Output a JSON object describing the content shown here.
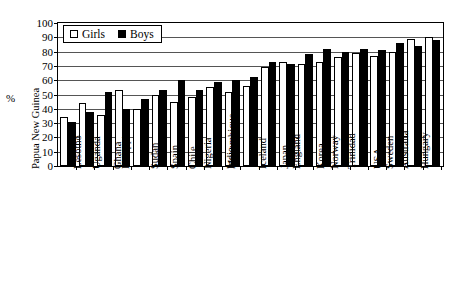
{
  "chart_data": {
    "type": "bar",
    "title": "",
    "xlabel": "",
    "ylabel": "%",
    "ylim": [
      0,
      100
    ],
    "ytick_step": 10,
    "yticks": [
      0,
      10,
      20,
      30,
      40,
      50,
      60,
      70,
      80,
      90,
      100
    ],
    "grid": true,
    "legend_position": "top-left-inside",
    "orientation": "vertical-grouped",
    "xtick_label_rotation": 90,
    "categories": [
      "Papua New Guinea",
      "Lesotho",
      "Uganda",
      "Ghana",
      "Philippines",
      "Sudan",
      "Spain",
      "Chile",
      "Nigeria",
      "India",
      "Mozambique",
      "Iceland",
      "Japan",
      "England",
      "Korea",
      "Norway",
      "Trinidad",
      "USA",
      "Sweden",
      "Australia",
      "Hungary"
    ],
    "series": [
      {
        "name": "Girls",
        "color": "#ffffff",
        "edge_color": "#000000",
        "values": [
          34,
          44,
          36,
          53,
          40,
          50,
          45,
          48,
          55,
          52,
          56,
          69,
          73,
          71,
          73,
          76,
          79,
          77,
          80,
          89,
          90
        ]
      },
      {
        "name": "Boys",
        "color": "#000000",
        "edge_color": "#000000",
        "values": [
          31,
          38,
          52,
          40,
          47,
          53,
          60,
          53,
          59,
          60,
          62,
          73,
          71,
          78,
          82,
          80,
          82,
          81,
          86,
          84,
          88
        ]
      }
    ]
  },
  "legend": {
    "items": [
      {
        "label": "Girls",
        "swatch": "open-square"
      },
      {
        "label": "Boys",
        "swatch": "filled-square"
      }
    ]
  },
  "axis": {
    "y_unit_label": "%"
  }
}
